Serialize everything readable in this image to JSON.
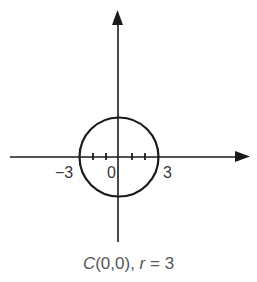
{
  "figure": {
    "axes": {
      "x_min_label": "−3",
      "origin_label": "0",
      "x_max_label": "3"
    },
    "circle": {
      "center": [
        0,
        0
      ],
      "radius": 3
    },
    "caption": {
      "center_symbol": "C",
      "center_coords": "(0,0),",
      "radius_symbol": "r",
      "radius_eq": " = 3"
    },
    "colors": {
      "ink": "#1a1a1a",
      "caption": "#555555"
    }
  }
}
